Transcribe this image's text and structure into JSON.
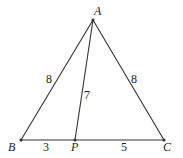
{
  "figure": {
    "type": "triangle-with-cevian",
    "points": {
      "A": {
        "label": "A",
        "x": 93,
        "y": 20
      },
      "B": {
        "label": "B",
        "x": 21,
        "y": 140
      },
      "P": {
        "label": "P",
        "x": 75,
        "y": 140
      },
      "C": {
        "label": "C",
        "x": 164,
        "y": 140
      }
    },
    "segments": {
      "AB": {
        "length": "8"
      },
      "AC": {
        "length": "8"
      },
      "AP": {
        "length": "7"
      },
      "BP": {
        "length": "3"
      },
      "PC": {
        "length": "5"
      }
    },
    "colors": {
      "line": "#333333",
      "point": "#333333"
    }
  }
}
